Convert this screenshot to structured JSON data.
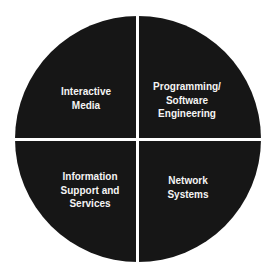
{
  "diagram": {
    "type": "quadrant-circle",
    "colors": {
      "fill": "#161616",
      "divider": "#ffffff",
      "text": "#f4f4f4",
      "background": "#ffffff"
    },
    "quadrants": [
      {
        "position": "top-left",
        "lines": [
          "Interactive",
          "Media"
        ]
      },
      {
        "position": "top-right",
        "lines": [
          "Programming/",
          "Software",
          "Engineering"
        ]
      },
      {
        "position": "bottom-left",
        "lines": [
          "Information",
          "Support and",
          "Services"
        ]
      },
      {
        "position": "bottom-right",
        "lines": [
          "Network",
          "Systems"
        ]
      }
    ]
  }
}
